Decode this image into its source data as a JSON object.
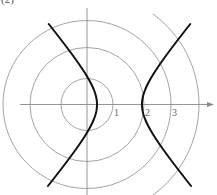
{
  "figure": {
    "label": "(2)"
  },
  "axes": {
    "origin_px": [
      87,
      104.5
    ],
    "x_axis": {
      "from_px": 20,
      "to_px": 214,
      "arrow": true
    },
    "y_axis": {
      "from_px": 8,
      "to_px": 195,
      "arrow": false
    },
    "tick_labels": [
      {
        "text": "1",
        "x": 114,
        "y": 116
      },
      {
        "text": "2",
        "x": 145,
        "y": 116
      },
      {
        "text": "3",
        "x": 172,
        "y": 116
      }
    ]
  },
  "circles": [
    {
      "name": "circle-r1",
      "radius_px": 26
    },
    {
      "name": "circle-r2",
      "radius_px": 57
    },
    {
      "name": "circle-r3",
      "radius_px": 84
    },
    {
      "name": "circle-outer-arc",
      "radius_px": 112,
      "partial": "right"
    }
  ],
  "hyperbola": {
    "center_px": [
      119.5,
      104.5
    ],
    "a_px": 22.5,
    "b_px": 27,
    "y_range_px": [
      24,
      186
    ]
  },
  "colors": {
    "curve": "#111111",
    "circles": "#9a9a9a",
    "axes": "#8a8a8a",
    "labels": "#666666"
  }
}
